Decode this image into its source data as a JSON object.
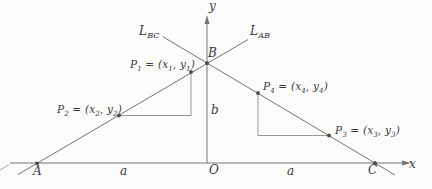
{
  "figure": {
    "colors": {
      "background": "#fbfbf9",
      "line": "#747474",
      "step_line": "#8c8c8c",
      "dot": "#4a4a4a",
      "text": "#3a3a3a"
    },
    "axes": {
      "x_label": "x",
      "y_label": "y",
      "origin_label": "O"
    },
    "lines": {
      "bc_label": "L_{BC}",
      "ab_label": "L_{AB}"
    },
    "vertices": {
      "a": "A",
      "b": "B",
      "c": "C"
    },
    "measures": {
      "base_left": "a",
      "base_right": "a",
      "height": "b"
    },
    "points": [
      {
        "label": "P_1 = (x_1, y_1)"
      },
      {
        "label": "P_2 = (x_2, y_2)"
      },
      {
        "label": "P_3 = (x_3, y_3)"
      },
      {
        "label": "P_4 = (x_4, y_4)"
      }
    ]
  }
}
